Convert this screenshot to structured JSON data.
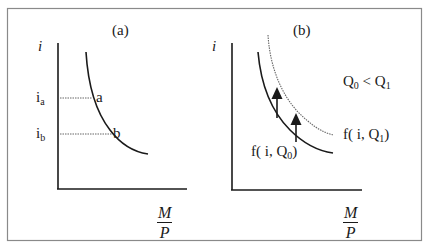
{
  "figure": {
    "panel_a": {
      "title": "(a)",
      "y_axis_label": "i",
      "x_axis_label": {
        "numerator": "M",
        "denominator": "P"
      },
      "levels": [
        {
          "base": "i",
          "sub": "a",
          "point": "a"
        },
        {
          "base": "i",
          "sub": "b",
          "point": "b"
        }
      ]
    },
    "panel_b": {
      "title": "(b)",
      "y_axis_label": "i",
      "x_axis_label": {
        "numerator": "M",
        "denominator": "P"
      },
      "condition": {
        "left": "Q",
        "left_sub": "0",
        "op": " < ",
        "right": "Q",
        "right_sub": "1"
      },
      "curve_q1": {
        "prefix": "f( i, Q",
        "sub": "1",
        "suffix": ")"
      },
      "curve_q0": {
        "prefix": "f( i, Q",
        "sub": "0",
        "suffix": ")"
      }
    },
    "colors": {
      "line": "#1a1a1a",
      "dotted": "#555555",
      "frame": "#888888",
      "background": "#ffffff"
    }
  }
}
